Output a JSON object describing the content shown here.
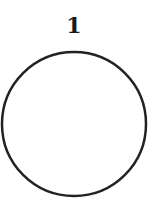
{
  "diagram": {
    "label": "1",
    "shape": "circle",
    "stroke_color": "#222222",
    "fill_color": "#ffffff",
    "center": [
      74,
      124
    ],
    "radius": 72
  }
}
